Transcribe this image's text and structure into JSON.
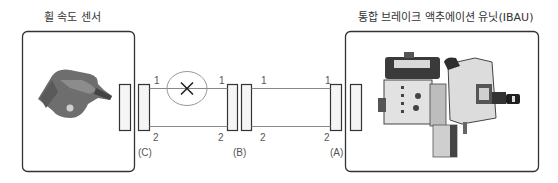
{
  "titles": {
    "left": "휠 속도 센서",
    "right": "통합 브레이크 액추에이션 유닛(IBAU)"
  },
  "components": {
    "left": {
      "name": "wheel-speed-sensor",
      "label": "휠 속도 센서"
    },
    "right": {
      "name": "integrated-brake-actuation-unit",
      "label": "통합 브레이크 액추에이션 유닛(IBAU)"
    }
  },
  "connectors": [
    {
      "id": "C",
      "label": "(C)"
    },
    {
      "id": "B",
      "label": "(B)"
    },
    {
      "id": "A",
      "label": "(A)"
    }
  ],
  "wires": {
    "segment1": {
      "top_left": "1",
      "top_right": "1",
      "bottom_left": "2",
      "bottom_right": "2"
    },
    "segment2": {
      "top_left": "1",
      "top_right": "1",
      "bottom_left": "2",
      "bottom_right": "2"
    }
  },
  "fault": {
    "wire": "1",
    "segment": "C-B",
    "symbol": "×"
  },
  "colors": {
    "line": "#333333",
    "wire": "#888888",
    "ellipse": "#999999"
  }
}
